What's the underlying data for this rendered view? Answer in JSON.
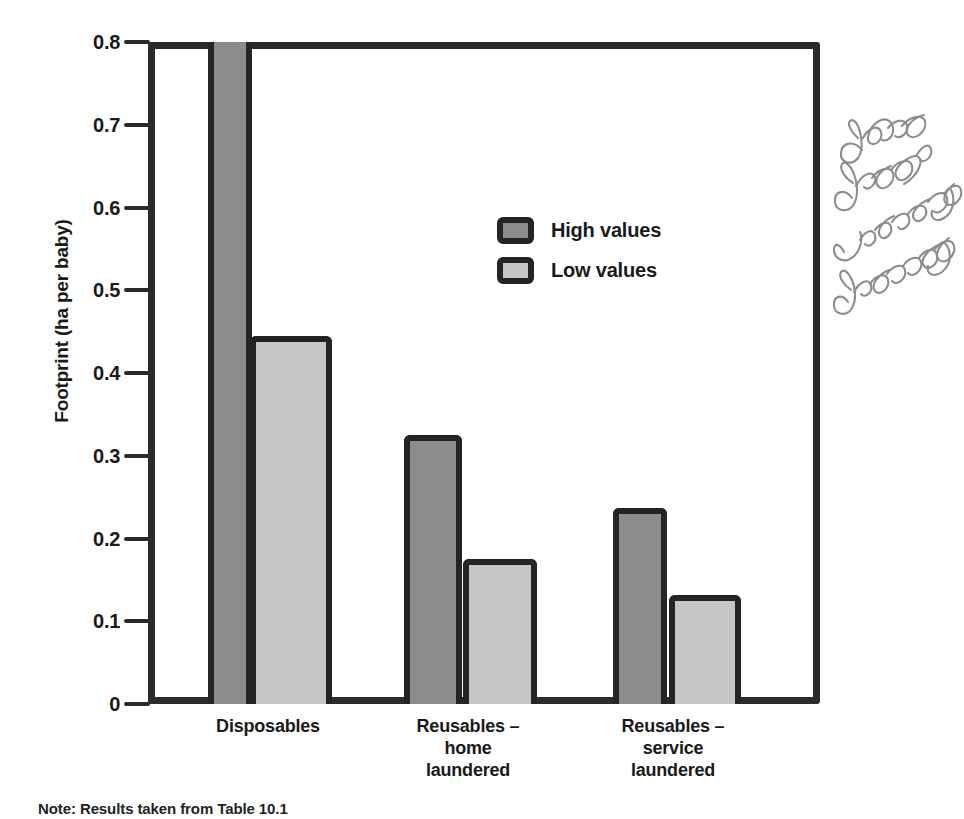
{
  "chart_data": {
    "type": "bar",
    "title": "",
    "xlabel": "",
    "ylabel": "Footprint (ha per baby)",
    "ylim": [
      0,
      0.8
    ],
    "ytick_labels": [
      "0.8",
      "0.7",
      "0.6",
      "0.5",
      "0.4",
      "0.3",
      "0.2",
      "0.1",
      "0"
    ],
    "ytick_values": [
      0.8,
      0.7,
      0.6,
      0.5,
      0.4,
      0.3,
      0.2,
      0.1,
      0
    ],
    "grid": true,
    "grid_axis": "y",
    "legend_position": "inside-upper-center",
    "note": "Bar for Disposables / High values is clipped at the top of the plot area (exceeds 0.8).",
    "categories": [
      "Disposables",
      "Reusables – home laundered",
      "Reusables – service laundered"
    ],
    "category_lines": [
      [
        "Disposables"
      ],
      [
        "Reusables –",
        "home",
        "laundered"
      ],
      [
        "Reusables –",
        "service",
        "laundered"
      ]
    ],
    "series": [
      {
        "name": "High values",
        "color": "#8c8c8c",
        "values": [
          0.8,
          0.325,
          0.237
        ]
      },
      {
        "name": "Low values",
        "color": "#c6c6c6",
        "values": [
          0.445,
          0.175,
          0.132
        ]
      }
    ]
  },
  "legend": {
    "items": [
      {
        "label": "High values",
        "swatch": "high"
      },
      {
        "label": "Low values",
        "swatch": "low"
      }
    ]
  },
  "annotation": {
    "handwritten_note": "good graph visually gripping"
  },
  "footer": {
    "source_note": "Note: Results taken from Table 10.1"
  },
  "colors": {
    "high_fill": "#8c8c8c",
    "low_fill": "#c6c6c6",
    "outline": "#242424",
    "gridline": "#9a9a9a",
    "background": "#ffffff",
    "handwriting": "#8d8d8d"
  }
}
